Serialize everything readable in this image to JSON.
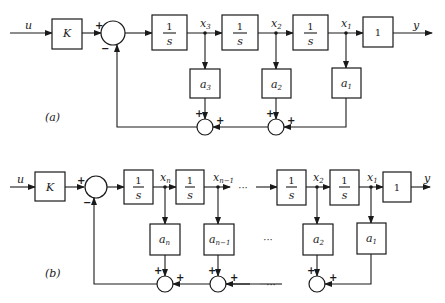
{
  "diagram_a": {
    "label": "(a)",
    "input": "u",
    "gain": "K",
    "integrator_num": "1",
    "integrator_den": "s",
    "output_block": "1",
    "output": "y",
    "states": [
      {
        "base": "x",
        "sub": "3"
      },
      {
        "base": "x",
        "sub": "2"
      },
      {
        "base": "x",
        "sub": "1"
      }
    ],
    "coeffs": [
      {
        "base": "a",
        "sub": "3"
      },
      {
        "base": "a",
        "sub": "2"
      },
      {
        "base": "a",
        "sub": "1"
      }
    ],
    "plus": "+",
    "minus": "−"
  },
  "diagram_b": {
    "label": "(b)",
    "input": "u",
    "gain": "K",
    "integrator_num": "1",
    "integrator_den": "s",
    "output_block": "1",
    "output": "y",
    "states": [
      {
        "base": "x",
        "sub": "n"
      },
      {
        "base": "x",
        "sub": "n−1"
      },
      {
        "base": "x",
        "sub": "2"
      },
      {
        "base": "x",
        "sub": "1"
      }
    ],
    "coeffs": [
      {
        "base": "a",
        "sub": "n"
      },
      {
        "base": "a",
        "sub": "n−1"
      },
      {
        "base": "a",
        "sub": "2"
      },
      {
        "base": "a",
        "sub": "1"
      }
    ],
    "ellipsis": "···",
    "plus": "+",
    "minus": "−"
  }
}
